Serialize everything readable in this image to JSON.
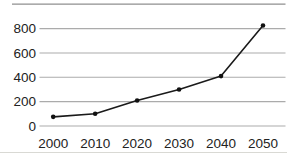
{
  "chart_data": {
    "type": "line",
    "categories": [
      "2000",
      "2010",
      "2020",
      "2030",
      "2040",
      "2050"
    ],
    "x": [
      2000,
      2010,
      2020,
      2030,
      2040,
      2050
    ],
    "series": [
      {
        "name": "series-1",
        "values": [
          75,
          100,
          210,
          300,
          410,
          825
        ]
      }
    ],
    "yticks": [
      0,
      200,
      400,
      600,
      800
    ],
    "ytick_labels": [
      "0",
      "200",
      "400",
      "600",
      "800"
    ],
    "ylim": [
      0,
      1000
    ],
    "grid": true,
    "legend": false,
    "marker": "filled-dot",
    "top_rule_value": 1000,
    "colors": {
      "line": "#1a1a1a",
      "marker": "#111111",
      "gridline": "#ababab",
      "top_rule": "#8f8f8f",
      "bottom_edge": "#d9d9d4",
      "label_text": "#222222",
      "background": "#ffffff"
    }
  }
}
